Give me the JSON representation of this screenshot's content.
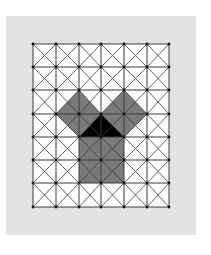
{
  "diagram": {
    "title": "",
    "grid": {
      "columns": 6,
      "rows": 7,
      "x_lines": [
        33,
        56,
        79,
        101,
        124,
        147,
        169
      ],
      "y_lines": [
        44,
        67,
        90,
        114,
        137,
        160,
        183,
        207
      ],
      "diagonals": true,
      "intersection_dots": true
    },
    "colors": {
      "frame": "#e2e2e2",
      "cell_bg": "#ffffff",
      "grid_line": "#3a3a3a",
      "square_fill": "#7a7a7a",
      "triangle_fill": "#000000"
    },
    "shapes": [
      {
        "name": "left-leg-square",
        "points": "79,137 56,114 79,90 101,114"
      },
      {
        "name": "right-leg-square",
        "points": "101,114 124,90 147,114 124,137"
      },
      {
        "name": "hypotenuse-square",
        "points": "79,137 124,137 124,183 79,183"
      },
      {
        "name": "right-triangle",
        "points": "79,137 124,137 101,114"
      }
    ]
  }
}
